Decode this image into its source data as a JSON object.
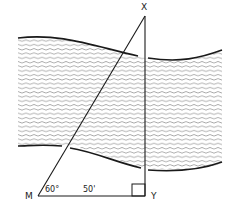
{
  "diagram": {
    "points": {
      "X": {
        "label": "X"
      },
      "M": {
        "label": "M"
      },
      "Y": {
        "label": "Y"
      }
    },
    "angle_M": "60°",
    "distance_MY": "50'",
    "right_angle_at": "Y",
    "elements": [
      "river",
      "triangle MXY",
      "right-angle marker"
    ],
    "colors": {
      "line": "#1a1a1a",
      "water": "#555555",
      "background": "#ffffff"
    }
  }
}
